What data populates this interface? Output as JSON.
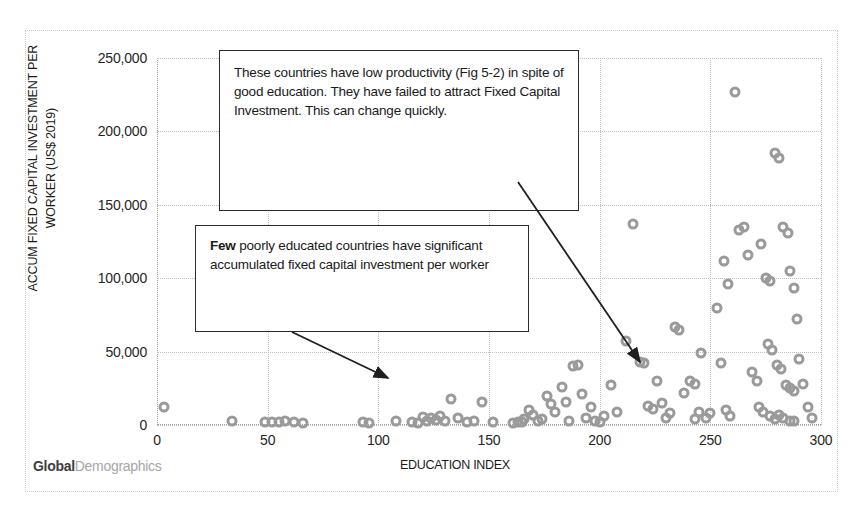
{
  "chart_data": {
    "type": "scatter",
    "title": "",
    "xlabel": "EDUCATION INDEX",
    "ylabel": "ACCUM FIXED CAPITAL INVESTMENT PER WORKER (US$ 2019)",
    "xlim": [
      0,
      300
    ],
    "ylim": [
      0,
      250000
    ],
    "xticks": [
      0,
      50,
      100,
      150,
      200,
      250,
      300
    ],
    "xtick_labels": [
      "0",
      "50",
      "100",
      "150",
      "200",
      "250",
      "300"
    ],
    "yticks": [
      0,
      50000,
      100000,
      150000,
      200000,
      250000
    ],
    "ytick_labels": [
      "0",
      "50,000",
      "100,000",
      "150,000",
      "200,000",
      "250,000"
    ],
    "grid": true,
    "legend": "none",
    "marker_style": "open-circle",
    "marker_color": "#9a9a9a",
    "points": [
      [
        3,
        12000
      ],
      [
        34,
        2500
      ],
      [
        49,
        2000
      ],
      [
        52,
        1800
      ],
      [
        55,
        2200
      ],
      [
        58,
        3000
      ],
      [
        62,
        2000
      ],
      [
        93,
        1800
      ],
      [
        108,
        2500
      ],
      [
        115,
        2200
      ],
      [
        120,
        5500
      ],
      [
        122,
        3000
      ],
      [
        124,
        4500
      ],
      [
        126,
        3200
      ],
      [
        128,
        6000
      ],
      [
        130,
        2500
      ],
      [
        133,
        18000
      ],
      [
        136,
        5000
      ],
      [
        147,
        16000
      ],
      [
        152,
        2200
      ],
      [
        161,
        1500
      ],
      [
        163,
        1800
      ],
      [
        165,
        2000
      ],
      [
        166,
        3800
      ],
      [
        168,
        10000
      ],
      [
        170,
        7000
      ],
      [
        172,
        3000
      ],
      [
        174,
        4200
      ],
      [
        176,
        20000
      ],
      [
        178,
        14000
      ],
      [
        180,
        9000
      ],
      [
        183,
        26000
      ],
      [
        185,
        16000
      ],
      [
        188,
        40000
      ],
      [
        190,
        41000
      ],
      [
        192,
        21000
      ],
      [
        194,
        5000
      ],
      [
        196,
        12000
      ],
      [
        198,
        3000
      ],
      [
        205,
        27000
      ],
      [
        208,
        9000
      ],
      [
        212,
        57000
      ],
      [
        215,
        137000
      ],
      [
        218,
        43000
      ],
      [
        220,
        42000
      ],
      [
        222,
        13000
      ],
      [
        224,
        11000
      ],
      [
        226,
        30000
      ],
      [
        228,
        15000
      ],
      [
        230,
        5000
      ],
      [
        232,
        8000
      ],
      [
        234,
        67000
      ],
      [
        236,
        65000
      ],
      [
        238,
        22000
      ],
      [
        241,
        30000
      ],
      [
        243,
        28000
      ],
      [
        246,
        49000
      ],
      [
        248,
        5000
      ],
      [
        250,
        8000
      ],
      [
        253,
        80000
      ],
      [
        256,
        112000
      ],
      [
        258,
        96000
      ],
      [
        261,
        227000
      ],
      [
        263,
        133000
      ],
      [
        265,
        135000
      ],
      [
        267,
        116000
      ],
      [
        269,
        36000
      ],
      [
        271,
        30000
      ],
      [
        273,
        123000
      ],
      [
        275,
        100000
      ],
      [
        277,
        98000
      ],
      [
        279,
        185000
      ],
      [
        281,
        182000
      ],
      [
        283,
        135000
      ],
      [
        285,
        131000
      ],
      [
        286,
        105000
      ],
      [
        288,
        93000
      ],
      [
        289,
        72000
      ],
      [
        276,
        55000
      ],
      [
        278,
        51000
      ],
      [
        280,
        41000
      ],
      [
        282,
        38000
      ],
      [
        284,
        27000
      ],
      [
        286,
        25000
      ],
      [
        288,
        23000
      ],
      [
        272,
        12000
      ],
      [
        274,
        9000
      ],
      [
        277,
        6000
      ],
      [
        279,
        4000
      ],
      [
        281,
        7000
      ],
      [
        283,
        5000
      ],
      [
        286,
        3000
      ],
      [
        288,
        2500
      ],
      [
        290,
        45000
      ],
      [
        292,
        28000
      ],
      [
        294,
        12000
      ],
      [
        296,
        5000
      ],
      [
        255,
        42000
      ],
      [
        257,
        10000
      ],
      [
        259,
        6000
      ],
      [
        243,
        4000
      ],
      [
        245,
        9000
      ],
      [
        200,
        2000
      ],
      [
        202,
        6000
      ],
      [
        186,
        2500
      ],
      [
        140,
        1800
      ],
      [
        143,
        2500
      ],
      [
        118,
        1500
      ],
      [
        96,
        1200
      ],
      [
        66,
        1500
      ]
    ]
  },
  "annotations": {
    "callout_productivity": {
      "text": "These countries have  low productivity (Fig 5-2) in spite of good education. They have failed to attract Fixed Capital Investment.   This can change quickly.",
      "arrow_from": [
        518,
        182
      ],
      "arrow_to": [
        640,
        362
      ]
    },
    "callout_poorly_educated": {
      "lead_bold": "Few",
      "text": " poorly educated countries have significant accumulated fixed capital investment per worker",
      "arrow_from": [
        292,
        332
      ],
      "arrow_to": [
        388,
        378
      ]
    }
  },
  "watermark": {
    "bold_part": "Global",
    "light_part": "Demographics"
  }
}
